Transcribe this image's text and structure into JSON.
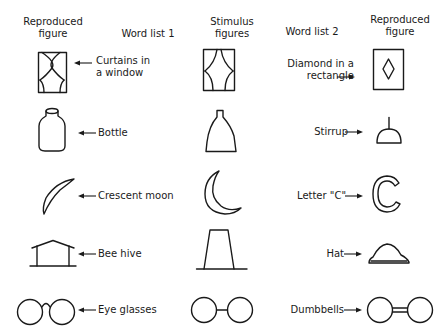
{
  "headers": {
    "reproduced_left": [
      "Reproduced",
      "figure"
    ],
    "word_list_1": "Word list 1",
    "stimulus": [
      "Stimulus",
      "figures"
    ],
    "word_list_2": "Word list 2",
    "reproduced_right": [
      "Reproduced",
      "figure"
    ]
  },
  "rows": [
    {
      "stimulus": "curtains-window-figure",
      "word1": [
        "Curtains in",
        "a window"
      ],
      "word2": [
        "Diamond in a",
        "rectangle"
      ],
      "repro1": "curtains-window-figure",
      "repro2": "diamond-rectangle-figure"
    },
    {
      "stimulus": "flask-figure",
      "word1": [
        "Bottle"
      ],
      "word2": [
        "Stirrup"
      ],
      "repro1": "bottle-figure",
      "repro2": "stirrup-figure"
    },
    {
      "stimulus": "crescent-figure",
      "word1": [
        "Crescent moon"
      ],
      "word2": [
        "Letter \"C\""
      ],
      "repro1": "crescent-moon-figure",
      "repro2": "letter-c-figure"
    },
    {
      "stimulus": "trapezoid-figure",
      "word1": [
        "Bee hive"
      ],
      "word2": [
        "Hat"
      ],
      "repro1": "bee-hive-figure",
      "repro2": "hat-figure"
    },
    {
      "stimulus": "two-circles-line-figure",
      "word1": [
        "Eye glasses"
      ],
      "word2": [
        "Dumbbells"
      ],
      "repro1": "eye-glasses-figure",
      "repro2": "dumbbells-figure"
    }
  ]
}
